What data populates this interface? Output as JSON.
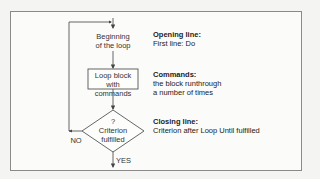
{
  "flowchart": {
    "start_node": {
      "line1": "Beginning",
      "line2": "of the loop"
    },
    "process_node": {
      "line1": "Loop block",
      "line2": "with commands"
    },
    "decision_node": {
      "symbol": "?",
      "line1": "Criterion",
      "line2": "fulfilled"
    },
    "edges": {
      "no_label": "NO",
      "yes_label": "YES"
    }
  },
  "annotations": [
    {
      "heading": "Opening line:",
      "text": "First line: Do"
    },
    {
      "heading": "Commands:",
      "text": "the block runthrough",
      "text2": "a number of times"
    },
    {
      "heading": "Closing line:",
      "text": "Criterion after Loop Until fulfilled"
    }
  ],
  "colors": {
    "line": "#555555",
    "frame": "#8a8a8a",
    "background": "#fbfbfa"
  }
}
